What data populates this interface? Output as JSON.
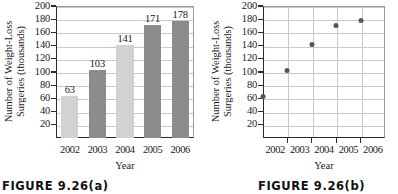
{
  "figures": [
    {
      "caption": "FIGURE 9.26(a)",
      "ylabel_line1": "Number of Weight-Loss",
      "ylabel_line2": "Surgeries (thousands)",
      "xlabel": "Year"
    },
    {
      "caption": "FIGURE 9.26(b)",
      "ylabel_line1": "Number of Weight-Loss",
      "ylabel_line2": "Surgeries (thousands)",
      "xlabel": "Year"
    }
  ],
  "yticks": [
    "200",
    "180",
    "160",
    "140",
    "120",
    "100",
    "80",
    "60",
    "40",
    "20"
  ],
  "xticks": [
    "2002",
    "2003",
    "2004",
    "2005",
    "2006"
  ],
  "colors": {
    "bar_light": "#d2d2d2",
    "bar_dark": "#8c8c8c",
    "dot": "#555555",
    "grid": "#c9c9c9",
    "axis": "#2a2a2a"
  },
  "chart_data": [
    {
      "type": "bar",
      "title": "FIGURE 9.26(a)",
      "categories": [
        "2002",
        "2003",
        "2004",
        "2005",
        "2006"
      ],
      "values": [
        63,
        103,
        141,
        171,
        178
      ],
      "labels": [
        "63",
        "103",
        "141",
        "171",
        "178"
      ],
      "bar_colors": [
        "#d2d2d2",
        "#8c8c8c",
        "#d2d2d2",
        "#8c8c8c",
        "#8c8c8c"
      ],
      "xlabel": "Year",
      "ylabel": "Number of Weight-Loss Surgeries (thousands)",
      "ylim": [
        0,
        200
      ],
      "ytick_step": 20,
      "grid": "horizontal",
      "legend": "none"
    },
    {
      "type": "scatter",
      "title": "FIGURE 9.26(b)",
      "x": [
        "2002",
        "2003",
        "2004",
        "2005",
        "2006"
      ],
      "values": [
        63,
        103,
        141,
        171,
        178
      ],
      "xlabel": "Year",
      "ylabel": "Number of Weight-Loss Surgeries (thousands)",
      "ylim": [
        0,
        200
      ],
      "ytick_step": 20,
      "grid": "both",
      "legend": "none"
    }
  ]
}
